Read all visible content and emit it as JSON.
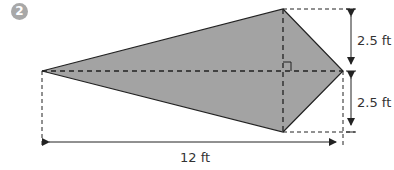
{
  "problem": {
    "number": "2"
  },
  "figure": {
    "shape": "kite",
    "fill_color": "#a3a3a3",
    "labels": {
      "top_height": "2.5 ft",
      "bottom_height": "2.5 ft",
      "width": "12 ft"
    }
  }
}
